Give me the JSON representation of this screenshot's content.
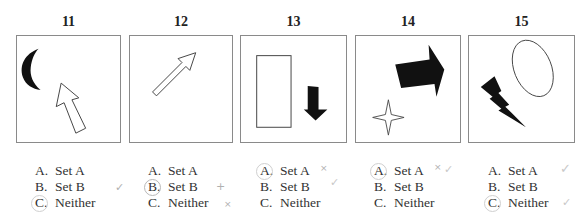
{
  "questions": [
    {
      "number": "11",
      "figures": [
        "black-crescent-moon",
        "outline-arrow-up"
      ],
      "options": [
        {
          "letter": "A.",
          "label": "Set A"
        },
        {
          "letter": "B.",
          "label": "Set B"
        },
        {
          "letter": "C.",
          "label": "Neither"
        }
      ],
      "circled": "C",
      "pencil_marks": [
        {
          "option": "B",
          "glyph": "✓"
        }
      ]
    },
    {
      "number": "12",
      "figures": [
        "outline-arrow-up-right"
      ],
      "options": [
        {
          "letter": "A.",
          "label": "Set A"
        },
        {
          "letter": "B.",
          "label": "Set B"
        },
        {
          "letter": "C.",
          "label": "Neither"
        }
      ],
      "circled": "B",
      "pencil_marks": [
        {
          "option": "B",
          "glyph": "+"
        },
        {
          "option": "C",
          "glyph": "×"
        }
      ]
    },
    {
      "number": "13",
      "figures": [
        "outline-rectangle",
        "black-arrow-down"
      ],
      "options": [
        {
          "letter": "A.",
          "label": "Set A"
        },
        {
          "letter": "B.",
          "label": "Set B"
        },
        {
          "letter": "C.",
          "label": "Neither"
        }
      ],
      "circled": "A",
      "pencil_marks": [
        {
          "option": "A",
          "glyph": "×"
        },
        {
          "option": "B",
          "glyph": "✓"
        }
      ]
    },
    {
      "number": "14",
      "figures": [
        "black-arrow-right",
        "outline-four-point-star"
      ],
      "options": [
        {
          "letter": "A.",
          "label": "Set A"
        },
        {
          "letter": "B.",
          "label": "Set B"
        },
        {
          "letter": "C.",
          "label": "Neither"
        }
      ],
      "circled": "A",
      "pencil_marks": [
        {
          "option": "A",
          "glyph": "×"
        },
        {
          "option": "A",
          "glyph": "✓"
        }
      ]
    },
    {
      "number": "15",
      "figures": [
        "black-lightning-bolt",
        "outline-ellipse"
      ],
      "options": [
        {
          "letter": "A.",
          "label": "Set A"
        },
        {
          "letter": "B.",
          "label": "Set B"
        },
        {
          "letter": "C.",
          "label": "Neither"
        }
      ],
      "circled": "C",
      "pencil_marks": [
        {
          "option": "A",
          "glyph": "✓"
        },
        {
          "option": "C",
          "glyph": "✓"
        }
      ]
    }
  ]
}
